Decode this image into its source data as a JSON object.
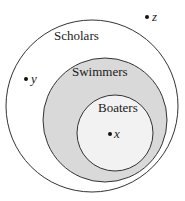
{
  "diagram": {
    "type": "venn-nested",
    "sets": [
      {
        "name": "Scholars",
        "fill": "#ffffff",
        "stroke": "#333333"
      },
      {
        "name": "Swimmers",
        "fill": "#d9d9d9",
        "stroke": "#333333"
      },
      {
        "name": "Boaters",
        "fill": "#f2f2f2",
        "stroke": "#333333"
      }
    ],
    "points": [
      {
        "label": "z",
        "location": "outside Scholars"
      },
      {
        "label": "y",
        "location": "in Scholars, not Swimmers"
      },
      {
        "label": "x",
        "location": "in Boaters"
      }
    ]
  }
}
